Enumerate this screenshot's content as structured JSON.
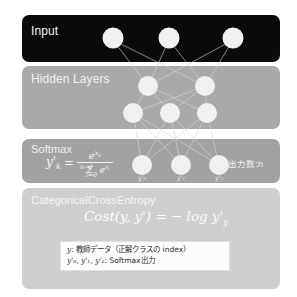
{
  "panels": {
    "input": {
      "label": "Input",
      "bg_color": "#0a0a0a",
      "node_count": 3
    },
    "hidden": {
      "label": "Hidden Layers",
      "bg_color": "#a9a9a9",
      "row1_node_count": 2,
      "row2_node_count": 3
    },
    "softmax": {
      "label": "Softmax",
      "bg_color": "#a2a2a2",
      "node_count": 3,
      "out_count_text": "出力数:n",
      "formula": {
        "lhs": "y'",
        "lhs_sub": "k",
        "equals": "=",
        "numerator": "e",
        "numerator_sup": "x",
        "numerator_sup_sub": "k",
        "denominator_sigma": "Σ",
        "denominator_sigma_sub": "i=0",
        "denominator_sigma_sup": "n−1",
        "denominator_term": "e",
        "denominator_term_sup": "x",
        "denominator_term_sup_sub": "i"
      },
      "node_labels": [
        "y'₀",
        "y'₁",
        "y'₂"
      ]
    },
    "cost": {
      "label": "CategoricalCrossEntropy",
      "bg_color": "#cfcfcf",
      "formula": {
        "func": "Cost",
        "args": "(y, y')",
        "equals": "=",
        "rhs": "− log y'",
        "rhs_sub": "y"
      }
    }
  },
  "legend": {
    "bg_color": "#fcfcfc",
    "lines": [
      {
        "symbol": "y",
        "separator": ": ",
        "text": "教師データ（正解クラスの index）"
      },
      {
        "symbol": "y'₀, y'₁, y'₂",
        "separator": ": ",
        "text": "Softmax出力"
      }
    ]
  },
  "style": {
    "node_fill": "#f0f0f0",
    "edge_color": "#d8d8d8"
  }
}
